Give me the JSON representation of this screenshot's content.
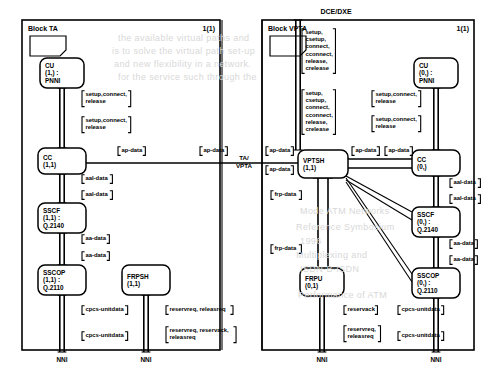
{
  "page": {
    "header_label": "DCE/DXE",
    "gateway_label_line1": "TA/",
    "gateway_label_line2": "VPTA"
  },
  "blocks": [
    {
      "id": "block-ta",
      "title": "Block TA",
      "page_number": "1(1)",
      "frame": {
        "x": 22,
        "y": 20,
        "w": 198,
        "h": 330
      },
      "processes": [
        {
          "id": "cu-ta",
          "name": "CU",
          "instance": "(1,) :",
          "protocol": "PNNI",
          "x": 40,
          "y": 58,
          "w": 44,
          "h": 30
        },
        {
          "id": "cc-ta",
          "name": "CC",
          "instance": "(1,1)",
          "protocol": "",
          "x": 38,
          "y": 148,
          "w": 48,
          "h": 26
        },
        {
          "id": "sscf-ta",
          "name": "SSCF",
          "instance": "(1,1) :",
          "protocol": "Q.2140",
          "x": 38,
          "y": 203,
          "w": 48,
          "h": 30
        },
        {
          "id": "sscop-ta",
          "name": "SSCOP",
          "instance": "(1,1) :",
          "protocol": "Q.2110",
          "x": 38,
          "y": 265,
          "w": 48,
          "h": 30
        },
        {
          "id": "frpsh-ta",
          "name": "FRPSH",
          "instance": "(1,1)",
          "protocol": "",
          "x": 122,
          "y": 265,
          "w": 48,
          "h": 30
        }
      ],
      "signal_labels": [
        {
          "id": "ta-cu-cc-1",
          "lines": [
            "setup,connect,",
            "release"
          ],
          "x": 82,
          "y": 96
        },
        {
          "id": "ta-cu-cc-2",
          "lines": [
            "setup,connect,",
            "release"
          ],
          "x": 82,
          "y": 122
        },
        {
          "id": "ta-cc-ap-out",
          "lines": [
            "ap-data"
          ],
          "x": 118,
          "y": 152
        },
        {
          "id": "ta-ap-far",
          "lines": [
            "ap-data"
          ],
          "x": 200,
          "y": 152
        },
        {
          "id": "ta-aal-1",
          "lines": [
            "aal-data"
          ],
          "x": 82,
          "y": 180
        },
        {
          "id": "ta-aal-2",
          "lines": [
            "aal-data"
          ],
          "x": 82,
          "y": 196
        },
        {
          "id": "ta-aa-1",
          "lines": [
            "aa-data"
          ],
          "x": 82,
          "y": 240
        },
        {
          "id": "ta-aa-2",
          "lines": [
            "aa-data"
          ],
          "x": 82,
          "y": 257
        },
        {
          "id": "ta-cpcs-1",
          "lines": [
            "cpcs-unitdata"
          ],
          "x": 82,
          "y": 311
        },
        {
          "id": "ta-cpcs-2",
          "lines": [
            "cpcs-unitdata"
          ],
          "x": 82,
          "y": 337
        },
        {
          "id": "ta-res-1",
          "lines": [
            "reservreq, releasreq"
          ],
          "x": 166,
          "y": 311
        },
        {
          "id": "ta-res-2",
          "lines": [
            "reservreq, reservack,",
            "releasreq"
          ],
          "x": 166,
          "y": 332
        }
      ],
      "gates": [
        {
          "id": "ta-nni-left",
          "label": "NNI",
          "x": 62,
          "y": 362
        },
        {
          "id": "ta-nni-right",
          "label": "NNI",
          "x": 146,
          "y": 362
        }
      ]
    },
    {
      "id": "block-vpta",
      "title": "Block VPTA",
      "page_number": "1(1)",
      "frame": {
        "x": 262,
        "y": 20,
        "w": 212,
        "h": 330
      },
      "processes": [
        {
          "id": "vptsh-vpta",
          "name": "VPTSH",
          "instance": "(1,1)",
          "protocol": "",
          "x": 298,
          "y": 150,
          "w": 50,
          "h": 28
        },
        {
          "id": "cu-vpta",
          "name": "CU",
          "instance": "(0,) :",
          "protocol": "PNNI",
          "x": 414,
          "y": 58,
          "w": 44,
          "h": 30
        },
        {
          "id": "cc-vpta",
          "name": "CC",
          "instance": "(0,)",
          "protocol": "",
          "x": 412,
          "y": 150,
          "w": 48,
          "h": 26
        },
        {
          "id": "sscf-vpta",
          "name": "SSCF",
          "instance": "(0,) :",
          "protocol": "Q.2140",
          "x": 412,
          "y": 207,
          "w": 48,
          "h": 30
        },
        {
          "id": "sscop-vpta",
          "name": "SSCOP",
          "instance": "(0,) :",
          "protocol": "Q.2110",
          "x": 412,
          "y": 268,
          "w": 48,
          "h": 30
        },
        {
          "id": "frpu-vpta",
          "name": "FRPU",
          "instance": "(0,1)",
          "protocol": "",
          "x": 300,
          "y": 268,
          "w": 44,
          "h": 28
        }
      ],
      "signal_labels": [
        {
          "id": "vpta-sig-1",
          "lines": [
            "setup,",
            "csetup,",
            "connect,",
            "cconnect,",
            "release,",
            "crelease"
          ],
          "x": 302,
          "y": 34
        },
        {
          "id": "vpta-sig-2",
          "lines": [
            "setup,",
            "csetup,",
            "connect,",
            "cconnect,",
            "release,",
            "crelease"
          ],
          "x": 302,
          "y": 95
        },
        {
          "id": "vpta-cu-cc-1",
          "lines": [
            "setup,connect,",
            "release"
          ],
          "x": 372,
          "y": 96
        },
        {
          "id": "vpta-cu-cc-2",
          "lines": [
            "setup,connect,",
            "release"
          ],
          "x": 372,
          "y": 121
        },
        {
          "id": "vpta-ap-in-1",
          "lines": [
            "ap-data"
          ],
          "x": 266,
          "y": 152
        },
        {
          "id": "vpta-ap-in-2",
          "lines": [
            "ap-data"
          ],
          "x": 266,
          "y": 171
        },
        {
          "id": "vpta-ap-mid-1",
          "lines": [
            "ap-data"
          ],
          "x": 352,
          "y": 152
        },
        {
          "id": "vpta-ap-mid-2",
          "lines": [
            "ap-data"
          ],
          "x": 385,
          "y": 152
        },
        {
          "id": "vpta-aal-1",
          "lines": [
            "aal-data"
          ],
          "x": 450,
          "y": 184
        },
        {
          "id": "vpta-aal-2",
          "lines": [
            "aal-data"
          ],
          "x": 450,
          "y": 200
        },
        {
          "id": "vpta-frp-1",
          "lines": [
            "frp-data"
          ],
          "x": 271,
          "y": 196
        },
        {
          "id": "vpta-frp-2",
          "lines": [
            "frp-data"
          ],
          "x": 271,
          "y": 250
        },
        {
          "id": "vpta-aa-1",
          "lines": [
            "aa-data"
          ],
          "x": 450,
          "y": 245
        },
        {
          "id": "vpta-aa-2",
          "lines": [
            "aa-data"
          ],
          "x": 450,
          "y": 261
        },
        {
          "id": "vpta-resack",
          "lines": [
            "reservack"
          ],
          "x": 344,
          "y": 311
        },
        {
          "id": "vpta-res-2",
          "lines": [
            "reservreq,",
            "releasreq"
          ],
          "x": 344,
          "y": 331
        },
        {
          "id": "vpta-cpcs-1",
          "lines": [
            "cpcs-unitdata"
          ],
          "x": 398,
          "y": 311
        },
        {
          "id": "vpta-cpcs-2",
          "lines": [
            "cpcs-unitdata"
          ],
          "x": 398,
          "y": 337
        }
      ],
      "gates": [
        {
          "id": "vpta-nni-left",
          "label": "NNI",
          "x": 322,
          "y": 362
        },
        {
          "id": "vpta-nni-right",
          "label": "NNI",
          "x": 436,
          "y": 362
        }
      ]
    }
  ],
  "bleed_text": [
    {
      "t": "the available virtual paths and",
      "x": 118,
      "y": 33
    },
    {
      "t": "is to solve the virtual path set-up",
      "x": 112,
      "y": 46
    },
    {
      "t": "and new flexibility in a network.",
      "x": 114,
      "y": 59
    },
    {
      "t": "for the service such through the",
      "x": 118,
      "y": 72
    },
    {
      "t": "Mode ATM Networks",
      "x": 300,
      "y": 206
    },
    {
      "t": "Reference Symbosium",
      "x": 296,
      "y": 222
    },
    {
      "t": "1996",
      "x": 300,
      "y": 236
    },
    {
      "t": "Multiplexing and",
      "x": 296,
      "y": 250
    },
    {
      "t": "ISDN-B-ISDN",
      "x": 300,
      "y": 264
    },
    {
      "t": "Performance of ATM",
      "x": 298,
      "y": 290
    }
  ]
}
